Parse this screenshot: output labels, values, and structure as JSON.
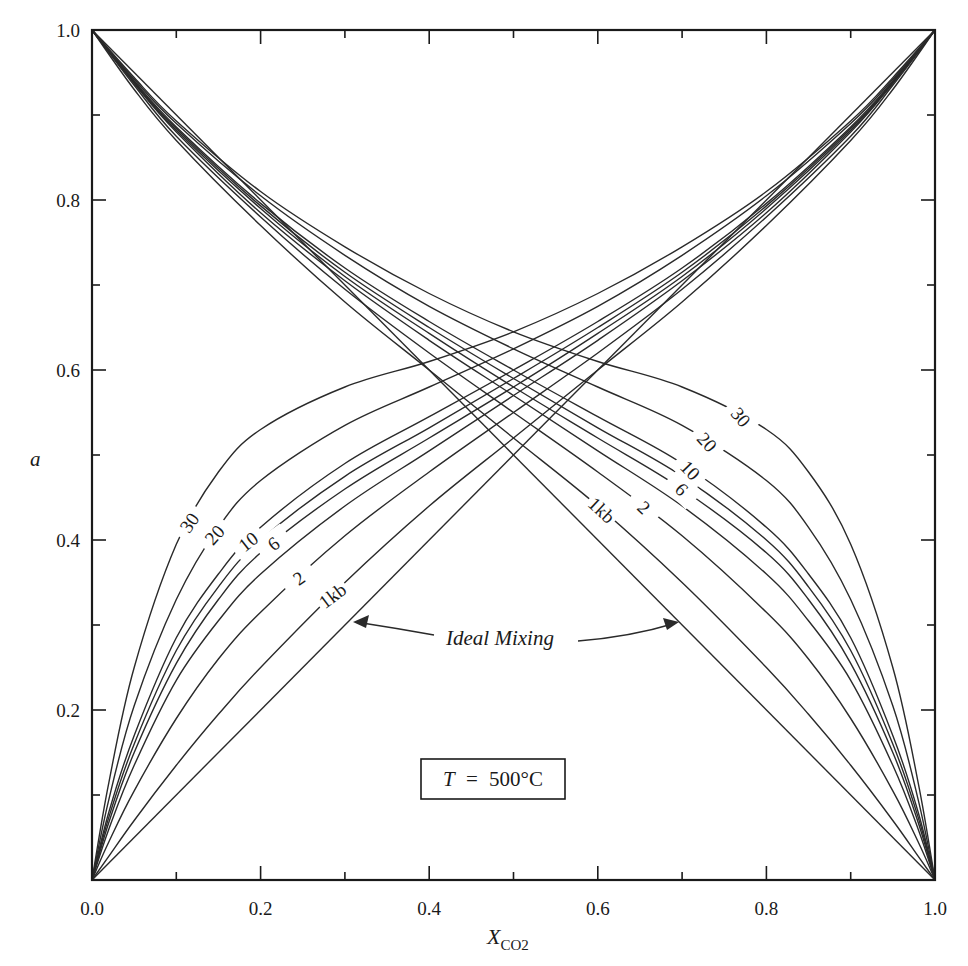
{
  "chart_data": {
    "type": "line",
    "title": "",
    "xlabel": "X",
    "xlabel_subscript": "CO2",
    "ylabel": "a",
    "xlim": [
      0.0,
      1.0
    ],
    "ylim": [
      0.0,
      1.0
    ],
    "x_ticks": [
      "0.0",
      "0.2",
      "0.4",
      "0.6",
      "0.8",
      "1.0"
    ],
    "y_ticks": [
      "0.2",
      "0.4",
      "0.6",
      "0.8",
      "1.0"
    ],
    "x_origin_label": "0.0",
    "grid": false,
    "x": [
      0.0,
      0.02,
      0.05,
      0.1,
      0.15,
      0.2,
      0.3,
      0.4,
      0.5,
      0.6,
      0.7,
      0.8,
      0.9,
      0.95,
      1.0
    ],
    "series_co2": [
      {
        "name": "1kb",
        "label": "1kb",
        "values": [
          0.0,
          0.028,
          0.07,
          0.135,
          0.195,
          0.25,
          0.35,
          0.44,
          0.52,
          0.6,
          0.68,
          0.77,
          0.87,
          0.93,
          1.0
        ]
      },
      {
        "name": "2kb",
        "label": "2",
        "values": [
          0.0,
          0.045,
          0.105,
          0.19,
          0.26,
          0.315,
          0.405,
          0.48,
          0.55,
          0.62,
          0.695,
          0.78,
          0.875,
          0.935,
          1.0
        ]
      },
      {
        "name": "4kb",
        "label": "",
        "values": [
          0.0,
          0.06,
          0.135,
          0.235,
          0.305,
          0.36,
          0.44,
          0.505,
          0.57,
          0.635,
          0.705,
          0.785,
          0.88,
          0.937,
          1.0
        ]
      },
      {
        "name": "6kb",
        "label": "6",
        "values": [
          0.0,
          0.068,
          0.15,
          0.255,
          0.33,
          0.385,
          0.46,
          0.52,
          0.58,
          0.643,
          0.71,
          0.79,
          0.882,
          0.938,
          1.0
        ]
      },
      {
        "name": "8kb",
        "label": "",
        "values": [
          0.0,
          0.074,
          0.16,
          0.27,
          0.345,
          0.4,
          0.475,
          0.532,
          0.59,
          0.65,
          0.715,
          0.793,
          0.884,
          0.939,
          1.0
        ]
      },
      {
        "name": "10kb",
        "label": "10",
        "values": [
          0.0,
          0.08,
          0.17,
          0.285,
          0.36,
          0.415,
          0.49,
          0.545,
          0.6,
          0.657,
          0.72,
          0.796,
          0.886,
          0.94,
          1.0
        ]
      },
      {
        "name": "20kb",
        "label": "20",
        "values": [
          0.0,
          0.095,
          0.205,
          0.33,
          0.415,
          0.47,
          0.535,
          0.58,
          0.625,
          0.675,
          0.735,
          0.805,
          0.89,
          0.942,
          1.0
        ]
      },
      {
        "name": "30kb",
        "label": "30",
        "values": [
          0.0,
          0.115,
          0.25,
          0.395,
          0.48,
          0.53,
          0.58,
          0.61,
          0.645,
          0.69,
          0.745,
          0.81,
          0.893,
          0.944,
          1.0
        ]
      }
    ],
    "ideal_mixing": {
      "label": "Ideal Mixing",
      "co2": [
        [
          0,
          0
        ],
        [
          1,
          1
        ]
      ],
      "h2o": [
        [
          0,
          1
        ],
        [
          1,
          0
        ]
      ]
    },
    "h2o_curves_note": "mirror of CO2 curves: a_H2O(X) = a_CO2 curve evaluated at (1 - X)",
    "h2o_labels": [
      "30",
      "20",
      "10",
      "6",
      "2",
      "1kb"
    ],
    "annotation_box": {
      "var": "T",
      "equals": "=",
      "value": "500",
      "unit": "°C"
    }
  }
}
